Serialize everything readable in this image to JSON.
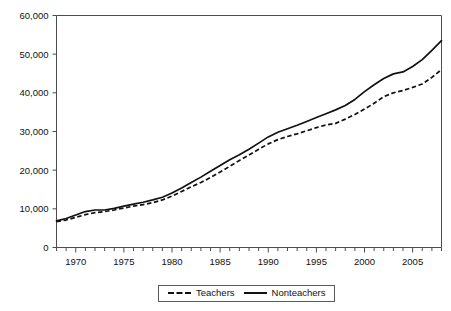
{
  "chart_data": {
    "type": "line",
    "title": "",
    "subtitle": "",
    "xlabel": "",
    "ylabel": "",
    "xlim": [
      1968,
      2008
    ],
    "ylim": [
      0,
      60000
    ],
    "grid": false,
    "legend_position": "bottom-center",
    "y_ticks": [
      0,
      10000,
      20000,
      30000,
      40000,
      50000,
      60000
    ],
    "y_tick_labels": [
      "0",
      "10,000",
      "20,000",
      "30,000",
      "40,000",
      "50,000",
      "60,000"
    ],
    "x_tick_labels": [
      "1970",
      "1975",
      "1980",
      "1985",
      "1990",
      "1995",
      "2000",
      "2005"
    ],
    "x_tick_values": [
      1970,
      1975,
      1980,
      1985,
      1990,
      1995,
      2000,
      2005
    ],
    "x_minor_ticks_every": 1,
    "x": [
      1968,
      1969,
      1970,
      1971,
      1972,
      1973,
      1974,
      1975,
      1976,
      1977,
      1978,
      1979,
      1980,
      1981,
      1982,
      1983,
      1984,
      1985,
      1986,
      1987,
      1988,
      1989,
      1990,
      1991,
      1992,
      1993,
      1994,
      1995,
      1996,
      1997,
      1998,
      1999,
      2000,
      2001,
      2002,
      2003,
      2004,
      2005,
      2006,
      2007,
      2008
    ],
    "series": [
      {
        "name": "Teachers",
        "style": "dashed",
        "color": "#111111",
        "values": [
          6700,
          7100,
          7800,
          8500,
          9000,
          9300,
          9700,
          10200,
          10700,
          11100,
          11600,
          12300,
          13300,
          14500,
          15700,
          16800,
          18100,
          19500,
          21000,
          22500,
          23900,
          25400,
          26800,
          27900,
          28700,
          29400,
          30200,
          31000,
          31700,
          32100,
          33200,
          34400,
          35800,
          37300,
          39000,
          40000,
          40600,
          41400,
          42300,
          44000,
          46000
        ]
      },
      {
        "name": "Nonteachers",
        "style": "solid",
        "color": "#111111",
        "values": [
          6900,
          7500,
          8400,
          9300,
          9700,
          9700,
          10100,
          10700,
          11200,
          11700,
          12300,
          13000,
          14100,
          15400,
          16800,
          18200,
          19700,
          21200,
          22700,
          24000,
          25400,
          27000,
          28600,
          29800,
          30700,
          31600,
          32600,
          33600,
          34600,
          35600,
          36700,
          38300,
          40300,
          42100,
          43700,
          44900,
          45400,
          46800,
          48600,
          51000,
          53500
        ]
      }
    ]
  },
  "legend": {
    "entries": [
      {
        "label": "Teachers",
        "style": "dashed"
      },
      {
        "label": "Nonteachers",
        "style": "solid"
      }
    ]
  }
}
